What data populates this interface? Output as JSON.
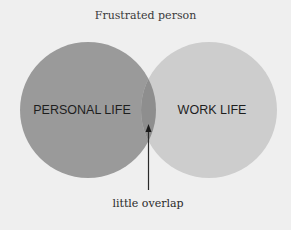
{
  "diagram": {
    "title": "Frustrated person",
    "sets": [
      {
        "label": "PERSONAL LIFE",
        "color": "#9a9a9a"
      },
      {
        "label": "WORK LIFE",
        "color": "#cdcdcd"
      }
    ],
    "overlap": {
      "color": "#8e8e8e"
    },
    "annotation": "little overlap",
    "background": "#efefef"
  }
}
